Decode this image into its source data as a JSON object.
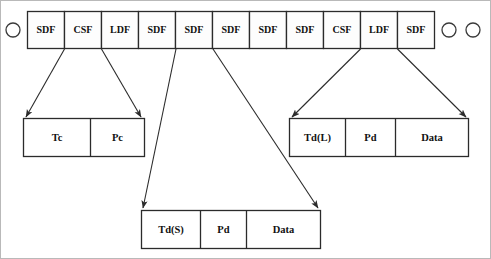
{
  "diagram": {
    "colors": {
      "stroke": "#2b2b2b",
      "frame": "#b9b9b9",
      "cell_fill": "#fdfdfd",
      "text": "#111111"
    },
    "frame_strip": {
      "name": "frame-strip",
      "cells": [
        {
          "label": "SDF"
        },
        {
          "label": "CSF"
        },
        {
          "label": "LDF"
        },
        {
          "label": "SDF"
        },
        {
          "label": "SDF"
        },
        {
          "label": "SDF"
        },
        {
          "label": "SDF"
        },
        {
          "label": "SDF"
        },
        {
          "label": "CSF"
        },
        {
          "label": "LDF"
        },
        {
          "label": "SDF"
        }
      ]
    },
    "node_circles": [
      {
        "name": "node-circle-left",
        "cx": 13,
        "cy": 30,
        "r": 7
      },
      {
        "name": "node-circle-right-1",
        "cx": 449,
        "cy": 30,
        "r": 7
      },
      {
        "name": "node-circle-right-2",
        "cx": 473,
        "cy": 30,
        "r": 7
      }
    ],
    "expansions": [
      {
        "name": "csf-expansion",
        "source": "CSF",
        "fields": [
          {
            "label": "Tc"
          },
          {
            "label": "Pc"
          }
        ]
      },
      {
        "name": "sdf-short-expansion",
        "source": "SDF",
        "fields": [
          {
            "label": "Td(S)"
          },
          {
            "label": "Pd"
          },
          {
            "label": "Data"
          }
        ]
      },
      {
        "name": "ldf-expansion",
        "source": "LDF",
        "fields": [
          {
            "label": "Td(L)"
          },
          {
            "label": "Pd"
          },
          {
            "label": "Data"
          }
        ]
      }
    ]
  }
}
